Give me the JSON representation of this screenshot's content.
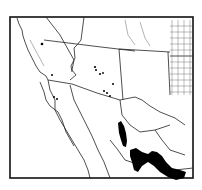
{
  "map": {
    "type": "distribution-range-map",
    "region": "Southwestern United States and northern Mexico",
    "colors": {
      "background": "#ffffff",
      "ink": "#111111",
      "range_fill": "#000000"
    },
    "features": {
      "frame": "rectangular border",
      "boundaries": [
        "state boundaries",
        "county grid (eastern area)",
        "Mexico state boundaries",
        "coastline",
        "rivers"
      ],
      "range_markers": "isolated black dots (Arizona, California, New Mexico)",
      "range_areas": "solid black filled regions in Mexico (Sierra Madre belt)"
    }
  }
}
